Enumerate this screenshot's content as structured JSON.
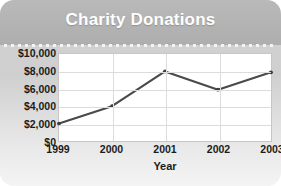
{
  "card": {
    "title": "Charity Donations",
    "header_color": "#b3b3b3",
    "title_color": "#ffffff",
    "background_color": "#d9d9d9"
  },
  "chart_data": {
    "type": "line",
    "title": "Charity Donations",
    "xlabel": "Year",
    "ylabel": "",
    "categories": [
      "1999",
      "2000",
      "2001",
      "2002",
      "2003"
    ],
    "values": [
      2000,
      4000,
      8000,
      5900,
      7900
    ],
    "series": [
      {
        "name": "Donations",
        "values": [
          2000,
          4000,
          8000,
          5900,
          7900
        ]
      }
    ],
    "ylim": [
      0,
      10000
    ],
    "ytick_step": 2000,
    "ytick_labels": [
      "$0",
      "$2,000",
      "$4,000",
      "$6,000",
      "$8,000",
      "$10,000"
    ],
    "ytick_values": [
      0,
      2000,
      4000,
      6000,
      8000,
      10000
    ],
    "xtick_labels": [
      "1999",
      "2000",
      "2001",
      "2002",
      "2003"
    ],
    "grid": true,
    "legend": false,
    "line_color": "#4a4a4a",
    "marker_color": "#3c3c3c",
    "gridline_color": "#dcdcdc"
  }
}
